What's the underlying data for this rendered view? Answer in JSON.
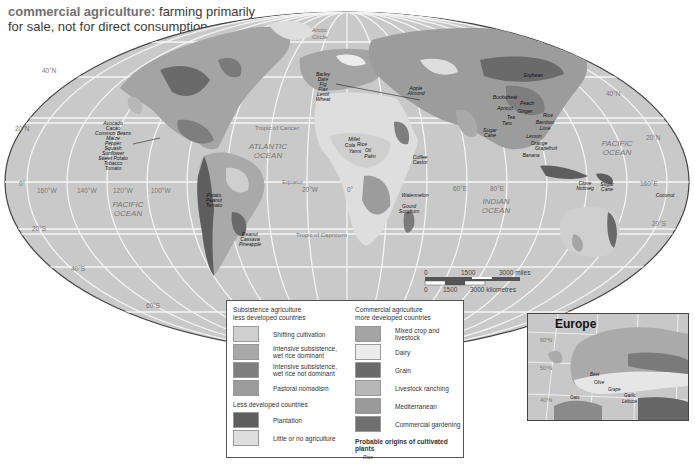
{
  "title": {
    "term": "commercial agriculture:",
    "definition": "farming primarily for sale, not for direct consumption"
  },
  "map": {
    "oceans": [
      {
        "name": "ATLANTIC OCEAN",
        "line1": "ATLANTIC",
        "line2": "OCEAN"
      },
      {
        "name": "PACIFIC OCEAN (west)",
        "line1": "PACIFIC",
        "line2": "OCEAN"
      },
      {
        "name": "PACIFIC OCEAN (east)",
        "line1": "PACIFIC",
        "line2": "OCEAN"
      },
      {
        "name": "INDIAN OCEAN",
        "line1": "INDIAN",
        "line2": "OCEAN"
      }
    ],
    "lines": {
      "arctic": "Arctic Circle",
      "arctic_1": "Arctic",
      "arctic_2": "Circle",
      "cancer": "Tropic of Cancer",
      "equator": "Equator",
      "capricorn": "Tropic of Capricorn"
    },
    "latitudes": [
      "40°N",
      "20°N",
      "0°",
      "20°S",
      "40°S",
      "60°S"
    ],
    "lat_labels": {
      "n40": "40°N",
      "n20": "20°N",
      "eq": "0°",
      "s20": "20°S",
      "s40": "40°S",
      "s60": "60°S",
      "n40e": "40°N",
      "n20e": "20°N",
      "s20e": "20°S"
    },
    "longitudes": {
      "w160": "160°W",
      "w140": "140°W",
      "w120": "120°W",
      "w100": "100°W",
      "w20": "20°W",
      "zero": "0°",
      "e60": "60°E",
      "e80": "80°E",
      "e160": "160°E"
    },
    "crop_labels": {
      "americas": [
        "Avocado",
        "Cacao",
        "Common Beans",
        "Maize",
        "Pepper",
        "Squash",
        "Sunflower",
        "Sweet Potato",
        "Tobacco",
        "Tomato"
      ],
      "andes": [
        "Potato",
        "Peanut",
        "Tomato"
      ],
      "brazil": [
        "Peanut",
        "Cassava",
        "Pineapple"
      ],
      "near_east": [
        "Barley",
        "Date",
        "Fig",
        "Flax",
        "Lentil",
        "Wheat"
      ],
      "central_asia": [
        "Apple",
        "Almond"
      ],
      "west_africa": [
        "Millet",
        "Cola",
        "Rice",
        "Yams",
        "Oil",
        "Palm"
      ],
      "east_africa": [
        "Coffee",
        "Castor"
      ],
      "south_africa": [
        "Watermelon",
        "Gourd",
        "Sorghum"
      ],
      "china": [
        "Soybean",
        "Buckwheat",
        "Peach",
        "Apricot",
        "Ginger",
        "Tea",
        "Rice",
        "Bamboo",
        "Lime",
        "Lemon",
        "Orange",
        "Grapefruit",
        "Banana"
      ],
      "india": [
        "Sugar",
        "Cane",
        "Taro"
      ],
      "se_asia": [
        "Clove",
        "Nutmeg",
        "Sugar",
        "Cane",
        "Coconut"
      ]
    },
    "scale": {
      "miles_0": "0",
      "miles_mid": "1500",
      "miles_end": "3000 miles",
      "km_0": "0",
      "km_mid": "1500",
      "km_end": "3000 kilometres"
    }
  },
  "legend": {
    "subsistence_heading": "Subsistence agriculture",
    "subsistence_sub": "less developed countries",
    "subsistence": [
      {
        "label": "Shifting cultivation",
        "color": "#cfcfcf"
      },
      {
        "label_1": "Intensive subsistence,",
        "label_2": "wet rice dominant",
        "color": "#a9a9a9"
      },
      {
        "label_1": "Intensive subsistence,",
        "label_2": "wet rice not dominant",
        "color": "#7e7e7e"
      },
      {
        "label": "Pastoral nomadism",
        "color": "#9c9c9c"
      }
    ],
    "ldc_heading": "Less developed countries",
    "ldc": [
      {
        "label": "Plantation",
        "color": "#5e5e5e"
      },
      {
        "label": "Little or no agriculture",
        "color": "#dedede"
      }
    ],
    "commercial_heading": "Commercial agriculture",
    "commercial_sub": "more developed countries",
    "commercial": [
      {
        "label": "Mixed crop and livestock",
        "color": "#a4a4a4"
      },
      {
        "label": "Dairy",
        "color": "#ececec"
      },
      {
        "label": "Grain",
        "color": "#6a6a6a"
      },
      {
        "label": "Livestock ranching",
        "color": "#b7b7b7"
      },
      {
        "label": "Mediterranean",
        "color": "#9a9a9a"
      },
      {
        "label": "Commercial gardening",
        "color": "#707070"
      }
    ],
    "origins_heading": "Probable origins of cultivated plants",
    "origins_example": "Rice"
  },
  "inset": {
    "title": "Europe",
    "lon_60s": "60°S",
    "lon_20e": "20°E",
    "lon_40e": "40°E",
    "lat_60n": "60°N",
    "lat_50n": "50°N",
    "lat_40n": "40°N",
    "crops": [
      "Beet",
      "Olive",
      "Grape",
      "Oats",
      "Garlic",
      "Lettuce"
    ]
  }
}
